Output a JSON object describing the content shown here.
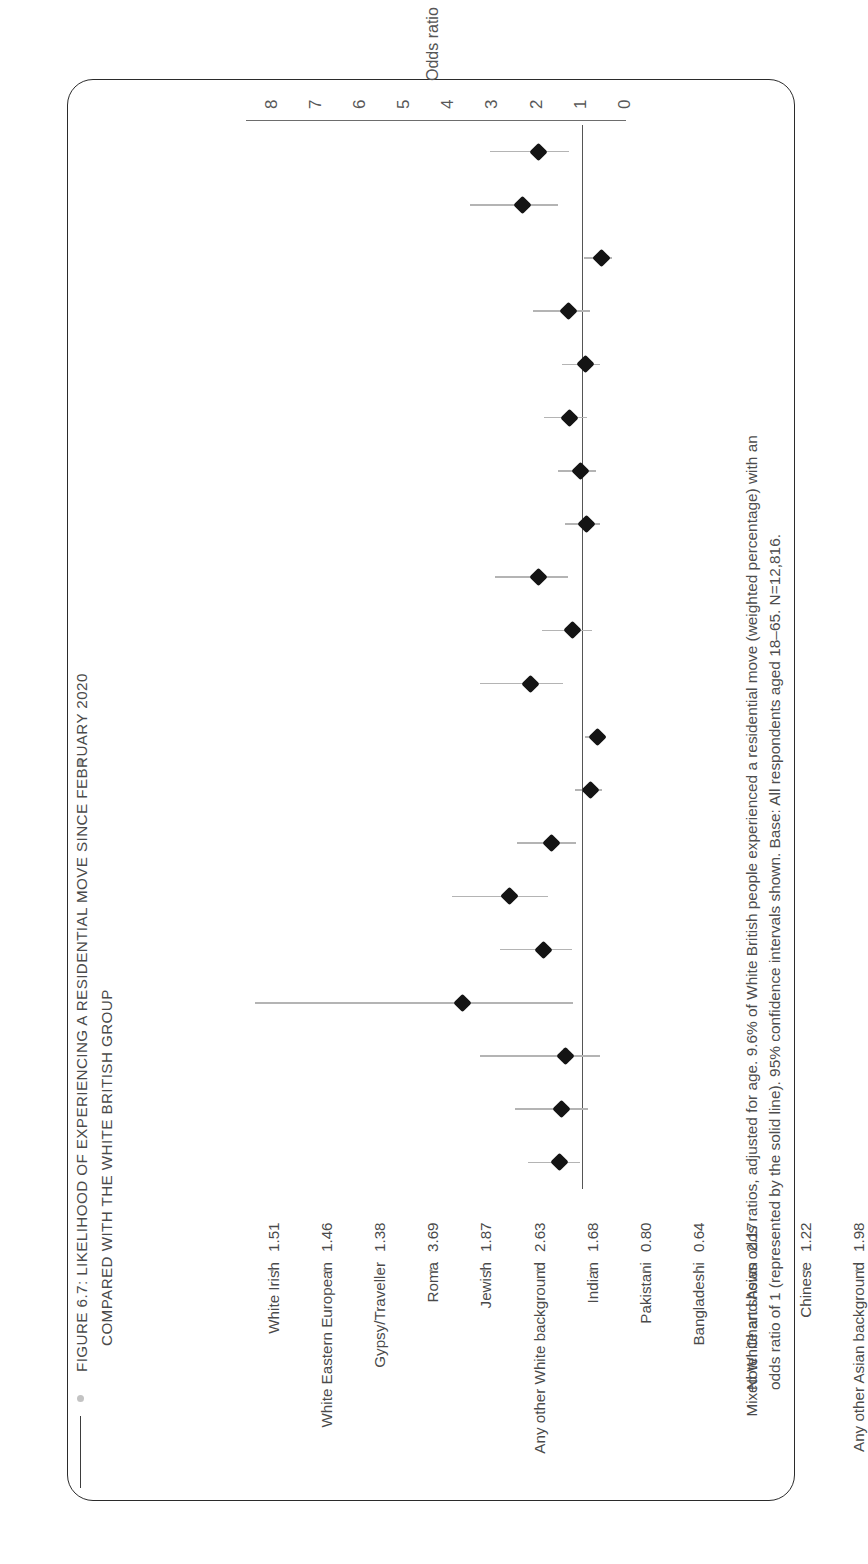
{
  "figure": {
    "title_line1": "FIGURE 6.7: LIKELIHOOD OF EXPERIENCING A RESIDENTIAL MOVE SINCE FEBRUARY 2020",
    "title_line2": "COMPARED WITH THE WHITE BRITISH GROUP",
    "note_line1": "Note: Chart shows odds ratios, adjusted for age. 9.6% of White British people experienced a residential move (weighted percentage) with an",
    "note_line2": "odds ratio of 1 (represented by the solid line). 95% confidence intervals shown. Base: All respondents aged 18–65. N=12,816."
  },
  "chart_data": {
    "type": "scatter",
    "title": "FIGURE 6.7: LIKELIHOOD OF EXPERIENCING A RESIDENTIAL MOVE SINCE FEBRUARY 2020 COMPARED WITH THE WHITE BRITISH GROUP",
    "xlabel": "Odds ratio",
    "ylabel": "",
    "xlim": [
      0,
      8.6
    ],
    "xticks": [
      "0",
      "1",
      "2",
      "3",
      "4",
      "5",
      "6",
      "7",
      "8"
    ],
    "xtick_values": [
      0,
      1,
      2,
      3,
      4,
      5,
      6,
      7,
      8
    ],
    "grid": false,
    "legend": null,
    "reference_line": 1,
    "categories": [
      "White Irish",
      "White Eastern European",
      "Gypsy/Traveller",
      "Roma",
      "Jewish",
      "Any other White background",
      "Indian",
      "Pakistani",
      "Bangladeshi",
      "Mixed White and Asian",
      "Chinese",
      "Any other Asian background",
      "Black Caribbean",
      "Mixed White and Black Caribbean",
      "Black African",
      "Mixed White and Black African",
      "Any other Black background",
      "Arab",
      "Any other mixed/multiple background",
      "Any other ethnic group"
    ],
    "values": [
      1.51,
      1.46,
      1.38,
      3.69,
      1.87,
      2.63,
      1.68,
      0.8,
      0.64,
      2.17,
      1.22,
      1.98,
      0.9,
      1.02,
      1.28,
      0.91,
      1.31,
      0.55,
      2.34,
      1.98
    ],
    "value_labels": [
      "1.51",
      "1.46",
      "1.38",
      "3.69",
      "1.87",
      "2.63",
      "1.68",
      "0.80",
      "0.64",
      "2.17",
      "1.22",
      "1.98",
      "0.90",
      "1.02",
      "1.28",
      "0.91",
      "1.31",
      "0.55",
      "2.34",
      "1.98"
    ],
    "ci_low": [
      1.03,
      0.85,
      0.58,
      1.2,
      1.22,
      1.76,
      1.14,
      0.55,
      0.45,
      1.43,
      0.78,
      1.32,
      0.59,
      0.68,
      0.88,
      0.58,
      0.82,
      0.32,
      1.55,
      1.28
    ],
    "ci_high": [
      2.21,
      2.52,
      3.3,
      8.4,
      2.85,
      3.93,
      2.47,
      1.16,
      0.92,
      3.3,
      1.91,
      2.97,
      1.38,
      1.54,
      1.86,
      1.44,
      2.1,
      0.96,
      3.53,
      3.07
    ],
    "marker": "diamond",
    "marker_color": "#141414",
    "ci_color": "#b4b4b4",
    "reference_line_color": "#555555"
  }
}
